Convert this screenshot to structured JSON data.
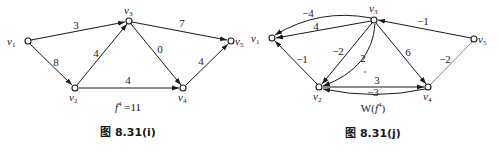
{
  "figure_i": {
    "caption": "图 8.31(i)",
    "subtitle": "f⁴ =11",
    "subtitle_main": "f",
    "subtitle_sup": "4",
    "subtitle_rest": " =11",
    "nodes": [
      {
        "id": "v1",
        "label": "v",
        "sub": "1"
      },
      {
        "id": "v2",
        "label": "v",
        "sub": "2"
      },
      {
        "id": "v3",
        "label": "v",
        "sub": "3"
      },
      {
        "id": "v4",
        "label": "v",
        "sub": "4"
      },
      {
        "id": "v5",
        "label": "v",
        "sub": "5"
      }
    ],
    "edges": [
      {
        "from": "v1",
        "to": "v3",
        "label": "3"
      },
      {
        "from": "v1",
        "to": "v2",
        "label": "8"
      },
      {
        "from": "v2",
        "to": "v3",
        "label": "4"
      },
      {
        "from": "v3",
        "to": "v5",
        "label": "7"
      },
      {
        "from": "v3",
        "to": "v4",
        "label": "0"
      },
      {
        "from": "v2",
        "to": "v4",
        "label": "4"
      },
      {
        "from": "v4",
        "to": "v5",
        "label": "4"
      }
    ]
  },
  "figure_j": {
    "caption": "图 8.31(j)",
    "subtitle": "W(f⁴)",
    "subtitle_pre": "W(",
    "subtitle_main": "f",
    "subtitle_sup": "4",
    "subtitle_post": ")",
    "nodes": [
      {
        "id": "v1",
        "label": "v",
        "sub": "1"
      },
      {
        "id": "v2",
        "label": "v",
        "sub": "2"
      },
      {
        "id": "v3",
        "label": "v",
        "sub": "3"
      },
      {
        "id": "v4",
        "label": "v",
        "sub": "4"
      },
      {
        "id": "v5",
        "label": "v",
        "sub": "5"
      }
    ],
    "edges": [
      {
        "from": "v3",
        "to": "v1",
        "label": "-4",
        "shape": "curved"
      },
      {
        "from": "v3",
        "to": "v1",
        "label": "4",
        "shape": "straight"
      },
      {
        "from": "v2",
        "to": "v1",
        "label": "-1"
      },
      {
        "from": "v3",
        "to": "v2",
        "label": "-2",
        "shape": "straight"
      },
      {
        "from": "v3",
        "to": "v2",
        "label": "2",
        "shape": "curved"
      },
      {
        "from": "v3",
        "to": "v4",
        "label": "6"
      },
      {
        "from": "v5",
        "to": "v3",
        "label": "-1"
      },
      {
        "from": "v4",
        "to": "v5",
        "label": "-2"
      },
      {
        "from": "v2",
        "to": "v4",
        "label": "3",
        "shape": "straight"
      },
      {
        "from": "v4",
        "to": "v2",
        "label": "-3",
        "shape": "curved"
      }
    ]
  }
}
